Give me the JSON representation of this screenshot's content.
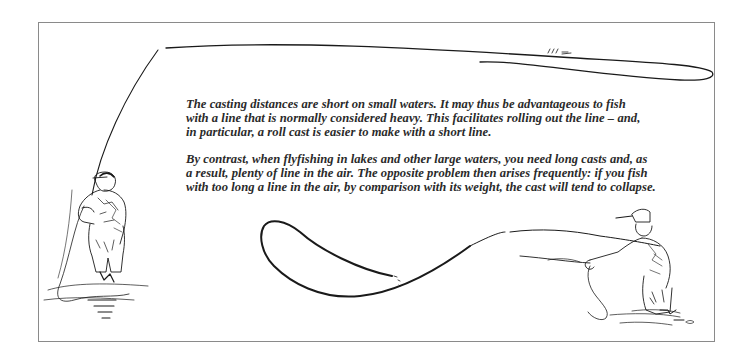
{
  "page": {
    "border_color": "#8a8a8a",
    "ink_color": "#1a1a1a",
    "text_color": "#2a2a2a"
  },
  "paragraphs": [
    {
      "text": "The casting distances are short on small waters. It may thus be advantageous to fish\nwith a line that is normally considered heavy. This facilitates rolling out the line – and,\nin particular, a roll cast is easier to make with a short line."
    },
    {
      "text": "By contrast, when flyfishing in lakes and other large waters, you need long casts and, as\na result, plenty of line in the air. The opposite problem then arises frequently: if you fish\nwith too long a line in the air, by comparison with its weight, the cast will tend to collapse."
    }
  ],
  "illustrations": {
    "left": "fisherman-short-line-roll-cast",
    "right": "fisherman-long-line-collapsing-cast"
  }
}
